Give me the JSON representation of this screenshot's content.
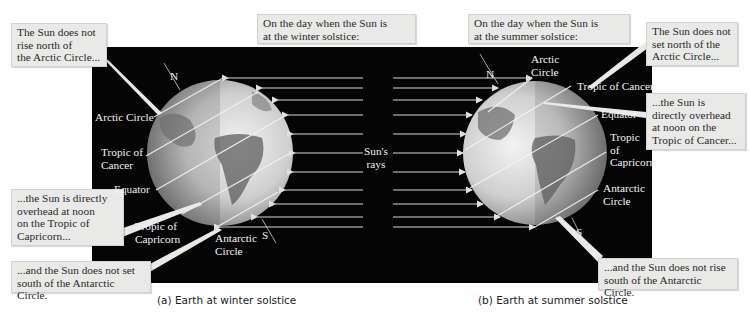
{
  "figure": {
    "rays_label": "Sun's\nrays",
    "panel_a": {
      "caption": "(a)  Earth at winter solstice",
      "header_callout": "On the day when the Sun is\nat the winter solstice:",
      "callouts": [
        "The Sun does not\nrise north of\nthe Arctic Circle...",
        "...the Sun is directly\noverhead at noon\non the Tropic of\nCapricorn...",
        "...and the Sun does not set\nsouth of the Antarctic Circle."
      ],
      "labels": {
        "north": "N",
        "south": "S",
        "arctic_circle": "Arctic Circle",
        "tropic_of_cancer": "Tropic of\nCancer",
        "equator": "Equator",
        "tropic_of_capricorn": "Tropic of\nCapricorn",
        "antarctic_circle": "Antarctic\nCircle"
      }
    },
    "panel_b": {
      "caption": "(b)  Earth at summer solstice",
      "header_callout": "On the day when the Sun is\nat the summer solstice:",
      "callouts": [
        "The Sun does not\nset north of the\nArctic Circle...",
        "...the Sun is\ndirectly overhead\nat noon on the\nTropic of Cancer...",
        "...and the Sun does not rise\nsouth of the Antarctic Circle."
      ],
      "labels": {
        "north": "N",
        "south": "S",
        "arctic_circle": "Arctic\nCircle",
        "tropic_of_cancer": "Tropic of Cancer",
        "equator": "Equator",
        "tropic_of_capricorn": "Tropic\nof\nCapricorn",
        "antarctic_circle": "Antarctic\nCircle"
      }
    },
    "colors": {
      "background": "#050505",
      "callout_bg": "#e9e9e7",
      "ray": "#d8d8d8",
      "label_text": "#f2f2f2"
    }
  }
}
